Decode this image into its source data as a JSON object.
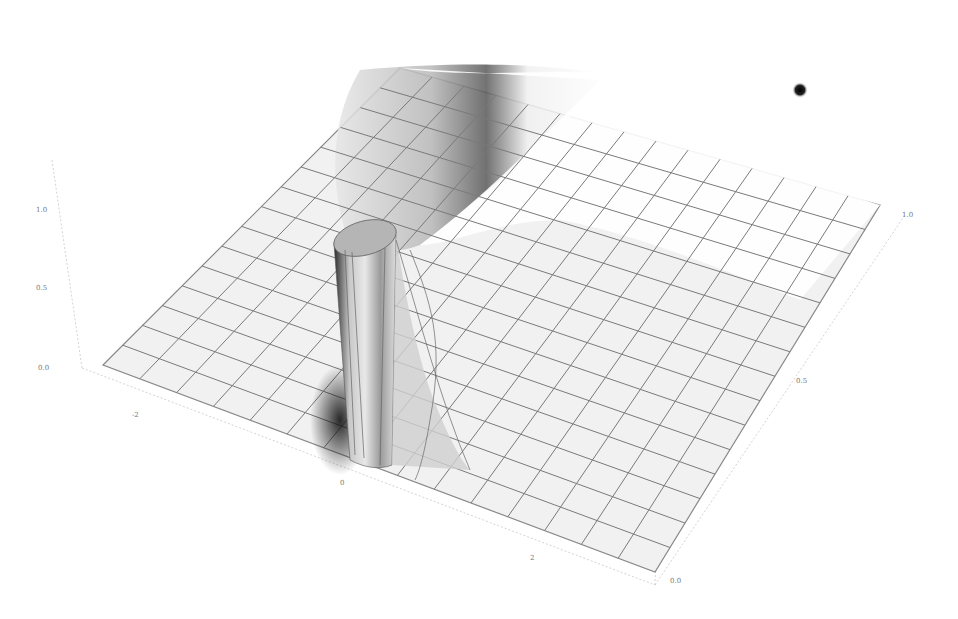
{
  "chart_data": {
    "type": "surface3d",
    "title": "",
    "axes": {
      "x": {
        "ticks": [
          "-2",
          "0",
          "2"
        ],
        "range": [
          -3,
          3
        ]
      },
      "y": {
        "ticks": [
          "0.0",
          "0.5",
          "1.0"
        ],
        "range": [
          0,
          1
        ]
      },
      "z": {
        "ticks": [
          "0.0",
          "0.5",
          "1.0"
        ],
        "range": [
          0,
          1
        ]
      }
    },
    "tick_labels": {
      "vertical_axis": [
        "0.0",
        "0.5",
        "1.0"
      ],
      "front_axis": [
        "-2",
        "0",
        "2"
      ],
      "right_axis": [
        "0.0",
        "0.5",
        "1.0"
      ]
    },
    "mesh": {
      "grid_lines": 15,
      "shading": "grayscale"
    },
    "grid": true,
    "legend": null
  },
  "marker": {
    "color": "#111111",
    "shape": "dot"
  }
}
